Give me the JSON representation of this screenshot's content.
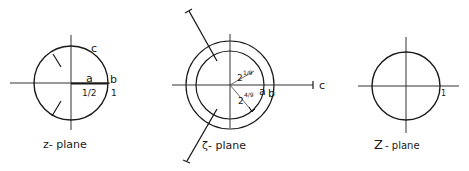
{
  "diagrams": [
    {
      "name": "z-plane",
      "caption": "z- plane",
      "labels": {
        "a": "a",
        "b": "b",
        "c": "c",
        "half": "1/2",
        "one": "1"
      }
    },
    {
      "name": "zeta-plane",
      "caption": "ζ- plane",
      "labels": {
        "a": "a",
        "b": "b",
        "c": "c",
        "inner_radius": "2^{1/9}",
        "outer_radius": "2^{4/9}",
        "inner_exp": "2",
        "inner_exp_sup": "1/9",
        "outer_exp": "2",
        "outer_exp_sup": "4/9"
      }
    },
    {
      "name": "Z-plane",
      "caption_main": "Z",
      "caption_rest": "- plane",
      "labels": {
        "one": "1"
      }
    }
  ],
  "colors": {
    "stroke": "#1a1a1a",
    "axis": "#333333",
    "background": "#ffffff"
  }
}
